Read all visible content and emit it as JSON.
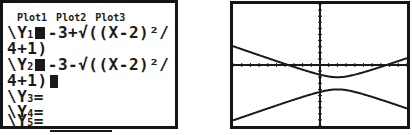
{
  "yeq_screen": {
    "plots": [
      "Plot1",
      "Plot2",
      "Plot3"
    ],
    "entries": [
      {
        "name": "Y",
        "sub": "1",
        "selected": true,
        "line1": "-3+√((X-2)²/",
        "line2": "4+1)"
      },
      {
        "name": "Y",
        "sub": "2",
        "selected": true,
        "line1": "-3-√((X-2)²/",
        "line2": "4+1)"
      },
      {
        "name": "Y",
        "sub": "3",
        "selected": false,
        "eq": "="
      },
      {
        "name": "Y",
        "sub": "4",
        "selected": false,
        "eq": "="
      },
      {
        "name": "Y",
        "sub": "5",
        "selected": false,
        "eq": "="
      }
    ],
    "prefix": "\\"
  },
  "graph_screen": {
    "window": {
      "xmin": -10,
      "xmax": 10,
      "xscl": 1,
      "ymin": -10,
      "ymax": 10,
      "yscl": 1
    },
    "curves": [
      {
        "name": "Y1",
        "expr": "-3+sqrt((X-2)^2/4+1)"
      },
      {
        "name": "Y2",
        "expr": "-3-sqrt((X-2)^2/4+1)"
      }
    ],
    "line_color": "#1a1a1a"
  }
}
